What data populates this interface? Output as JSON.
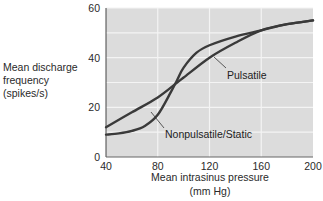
{
  "chart_data": {
    "type": "line",
    "title": "",
    "xlabel": "Mean intrasinus pressure",
    "xlabel_unit": "(mm Hg)",
    "ylabel_lines": [
      "Mean discharge",
      "frequency",
      "(spikes/s)"
    ],
    "ylabel": "Mean discharge frequency (spikes/s)",
    "xlim": [
      40,
      200
    ],
    "ylim": [
      0,
      60
    ],
    "x_ticks": [
      40,
      80,
      120,
      160,
      200
    ],
    "y_ticks": [
      0,
      20,
      40,
      60
    ],
    "x_tick_labels": [
      "40",
      "80",
      "120",
      "160",
      "200"
    ],
    "y_tick_labels": [
      "0",
      "20",
      "40",
      "60"
    ],
    "grid": true,
    "grid_y_step": 10,
    "grid_x_step": 40,
    "legend": "none (direct annotations)",
    "background": "#dcdcdc",
    "grid_color": "#f4f4f4",
    "line_color": "#3a3a3a",
    "series": [
      {
        "name": "Pulsatile",
        "x": [
          40,
          60,
          80,
          95,
          100,
          120,
          140,
          160,
          180,
          200
        ],
        "values": [
          12,
          18,
          24,
          30,
          32,
          40,
          46,
          51,
          53.5,
          55
        ]
      },
      {
        "name": "Nonpulsatile/Static",
        "x": [
          40,
          50,
          60,
          70,
          80,
          90,
          95,
          100,
          110,
          120,
          140,
          160,
          180,
          200
        ],
        "values": [
          9,
          9.5,
          10.5,
          12.5,
          17,
          26,
          31,
          36,
          42,
          45,
          48.5,
          51,
          53.5,
          55
        ]
      }
    ],
    "annotations": [
      {
        "text": "Pulsatile",
        "points_to_series": "Pulsatile",
        "near_x": 128
      },
      {
        "text": "Nonpulsatile/Static",
        "points_to_series": "Nonpulsatile/Static",
        "near_x": 76
      }
    ]
  }
}
